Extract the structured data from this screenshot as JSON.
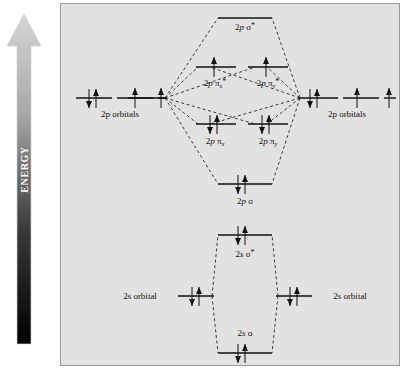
{
  "figure": {
    "type": "molecular-orbital-energy-diagram",
    "axis_label": "ENERGY",
    "axis_direction": "upward",
    "panel_background": "#e2e2e2",
    "panel_border": "#9a9a9a",
    "arrow_gradient_top": "#d2d2d2",
    "arrow_gradient_bottom": "#000000"
  },
  "atomic_labels": {
    "left_2p": "2p orbitals",
    "right_2p": "2p orbitals",
    "left_2s": "2s orbital",
    "right_2s": "2s orbital"
  },
  "molecular_levels": [
    {
      "id": "2p-sigma-star",
      "label_html": "2<i>p</i> &sigma;<sup>*</sup>",
      "label_text": "2p σ*",
      "electrons": 0,
      "spins": []
    },
    {
      "id": "2p-pi-x-star",
      "label_html": "2<i>p</i> &pi;<sub>x</sub><sup>*</sup>",
      "label_text": "2p πx*",
      "electrons": 1,
      "spins": [
        "up"
      ]
    },
    {
      "id": "2p-pi-y-star",
      "label_html": "2<i>p</i> &pi;<sub>y</sub><sup>*</sup>",
      "label_text": "2p πy*",
      "electrons": 1,
      "spins": [
        "up"
      ]
    },
    {
      "id": "2p-pi-x",
      "label_html": "2<i>p</i> &pi;<sub>x</sub>",
      "label_text": "2p πx",
      "electrons": 2,
      "spins": [
        "down",
        "up"
      ]
    },
    {
      "id": "2p-pi-y",
      "label_html": "2<i>p</i> &pi;<sub>y</sub>",
      "label_text": "2p πy",
      "electrons": 2,
      "spins": [
        "down",
        "up"
      ]
    },
    {
      "id": "2p-sigma",
      "label_html": "2<i>p</i> &sigma;",
      "label_text": "2p σ",
      "electrons": 2,
      "spins": [
        "down",
        "up"
      ]
    },
    {
      "id": "2s-sigma-star",
      "label_html": "2<i>s</i> &sigma;<sup>*</sup>",
      "label_text": "2s σ*",
      "electrons": 2,
      "spins": [
        "down",
        "up"
      ]
    },
    {
      "id": "2s-sigma",
      "label_html": "2<i>s</i> &sigma;",
      "label_text": "2s σ",
      "electrons": 2,
      "spins": [
        "down",
        "up"
      ]
    }
  ],
  "atomic_levels": [
    {
      "id": "left-2p-1",
      "electrons": 2,
      "spins": [
        "down",
        "up"
      ]
    },
    {
      "id": "left-2p-2",
      "electrons": 1,
      "spins": [
        "up"
      ]
    },
    {
      "id": "left-2p-3",
      "electrons": 1,
      "spins": [
        "up"
      ]
    },
    {
      "id": "right-2p-1",
      "electrons": 2,
      "spins": [
        "down",
        "up"
      ]
    },
    {
      "id": "right-2p-2",
      "electrons": 1,
      "spins": [
        "up"
      ]
    },
    {
      "id": "right-2p-3",
      "electrons": 1,
      "spins": [
        "up"
      ]
    },
    {
      "id": "left-2s",
      "electrons": 2,
      "spins": [
        "down",
        "up"
      ]
    },
    {
      "id": "right-2s",
      "electrons": 2,
      "spins": [
        "down",
        "up"
      ]
    }
  ]
}
